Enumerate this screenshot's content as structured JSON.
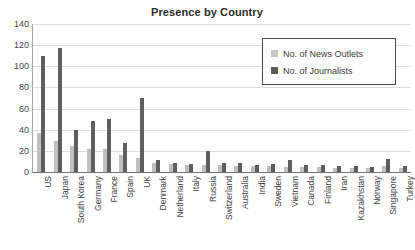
{
  "chart_data": {
    "type": "bar",
    "title": "Presence by Country",
    "xlabel": "",
    "ylabel": "",
    "ylim": [
      0,
      140
    ],
    "yticks": [
      0,
      20,
      40,
      60,
      80,
      100,
      120,
      140
    ],
    "grid": true,
    "legend_position": "top-right",
    "categories": [
      "US",
      "Japan",
      "South Korea",
      "Germany",
      "France",
      "Spain",
      "UK",
      "Denmark",
      "Netherland",
      "Italy",
      "Russia",
      "Switzerland",
      "Australia",
      "India",
      "Sweden",
      "Vietnam",
      "Canada",
      "Finland",
      "Iran",
      "Kazakhstan",
      "Norway",
      "Singapore",
      "Turkey"
    ],
    "series": [
      {
        "name": "No. of News Outlets",
        "color": "#bfbfbf",
        "values": [
          37,
          29,
          25,
          22,
          22,
          16,
          13,
          9,
          8,
          7,
          7,
          7,
          6,
          6,
          6,
          5,
          5,
          5,
          4,
          4,
          4,
          6,
          4
        ]
      },
      {
        "name": "No. of Journalists",
        "color": "#5e5e5e",
        "values": [
          110,
          117,
          40,
          48,
          50,
          27,
          70,
          11,
          9,
          8,
          20,
          9,
          9,
          7,
          8,
          11,
          7,
          7,
          6,
          6,
          5,
          12,
          6
        ]
      }
    ]
  },
  "legend": {
    "items": [
      {
        "label": "No. of News Outlets"
      },
      {
        "label": "No. of Journalists"
      }
    ]
  },
  "colors": {
    "outlets": "#bfbfbf",
    "journalists": "#5e5e5e",
    "grid": "#dedede",
    "axis": "#6f6f6f",
    "text": "#3b3b3b"
  }
}
